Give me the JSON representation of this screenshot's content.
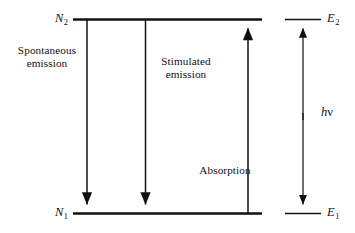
{
  "figure": {
    "type": "energy-level-transition-diagram",
    "background_color": "#ffffff",
    "line_color": "#111111"
  },
  "levels": {
    "upper": {
      "population_label": "N",
      "population_subscript": "2",
      "energy_label": "E",
      "energy_subscript": "2"
    },
    "lower": {
      "population_label": "N",
      "population_subscript": "1",
      "energy_label": "E",
      "energy_subscript": "1"
    }
  },
  "processes": [
    {
      "name": "spontaneous-emission",
      "label_line1": "Spontaneous",
      "label_line2": "emission",
      "direction": "down"
    },
    {
      "name": "stimulated-emission",
      "label_line1": "Stimulated",
      "label_line2": "emission",
      "direction": "down"
    },
    {
      "name": "absorption",
      "label_line1": "Absorption",
      "label_line2": "",
      "direction": "up"
    }
  ],
  "energy_gap": {
    "symbol_h": "h",
    "symbol_nu": "ν"
  }
}
